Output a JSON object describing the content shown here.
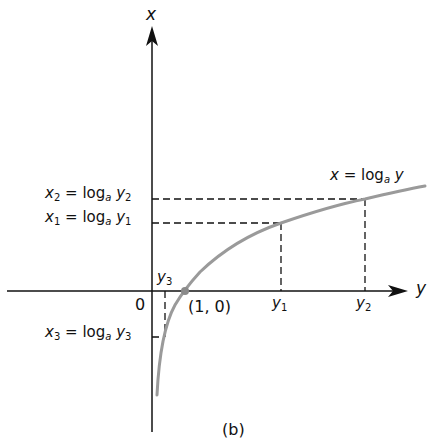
{
  "figure": {
    "caption": "(b)",
    "axis_labels": {
      "vertical": "x",
      "horizontal": "y"
    },
    "origin_label": "0",
    "curve_label": {
      "lhs": "x",
      "op": "= log",
      "base": "a",
      "arg": "y"
    },
    "point_label": "(1, 0)",
    "annotations": {
      "x2": {
        "var": "x",
        "sub": "2",
        "op": "= log",
        "base": "a",
        "arg": "y",
        "arg_sub": "2"
      },
      "x1": {
        "var": "x",
        "sub": "1",
        "op": "= log",
        "base": "a",
        "arg": "y",
        "arg_sub": "1"
      },
      "x3": {
        "var": "x",
        "sub": "3",
        "op": "= log",
        "base": "a",
        "arg": "y",
        "arg_sub": "3"
      },
      "y1": {
        "var": "y",
        "sub": "1"
      },
      "y2": {
        "var": "y",
        "sub": "2"
      },
      "y3": {
        "var": "y",
        "sub": "3"
      }
    },
    "colors": {
      "axis": "#111111",
      "curve": "#9a9a9a",
      "dash": "#111111"
    }
  }
}
